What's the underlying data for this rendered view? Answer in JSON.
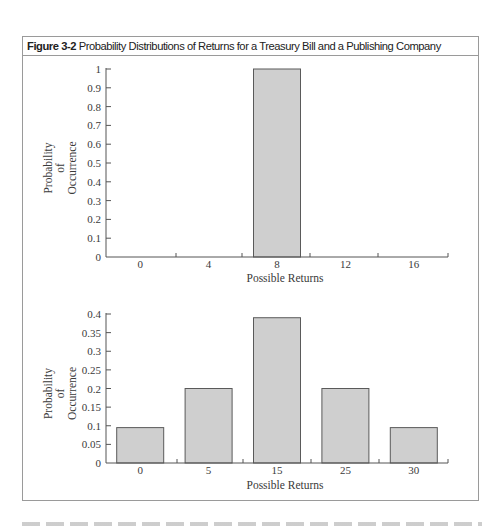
{
  "figure": {
    "label": "Figure 3-2",
    "title": "Probability Distributions of Returns for a Treasury Bill and a Publishing Company"
  },
  "chart_data": [
    {
      "type": "bar",
      "title": "Treasury Bill",
      "xlabel": "Possible Returns",
      "ylabel": [
        "Probability",
        "of",
        "Occurrence"
      ],
      "categories": [
        "0",
        "4",
        "8",
        "12",
        "16"
      ],
      "values": [
        0,
        0,
        1.0,
        0,
        0
      ],
      "ylim": [
        0,
        1
      ],
      "yticks": [
        "0",
        "0.1",
        "0.2",
        "0.3",
        "0.4",
        "0.5",
        "0.6",
        "0.7",
        "0.8",
        "0.9",
        "1"
      ],
      "ytick_values": [
        0,
        0.1,
        0.2,
        0.3,
        0.4,
        0.5,
        0.6,
        0.7,
        0.8,
        0.9,
        1
      ],
      "grid": false,
      "bar_color": "#cfcfcf"
    },
    {
      "type": "bar",
      "title": "Publishing Company",
      "xlabel": "Possible Returns",
      "ylabel": [
        "Probability",
        "of",
        "Occurrence"
      ],
      "categories": [
        "0",
        "5",
        "15",
        "25",
        "30"
      ],
      "values": [
        0.095,
        0.2,
        0.39,
        0.2,
        0.095
      ],
      "ylim": [
        0,
        0.4
      ],
      "yticks": [
        "0",
        "0.05",
        "0.1",
        "0.15",
        "0.2",
        "0.25",
        "0.3",
        "0.35",
        "0.4"
      ],
      "ytick_values": [
        0,
        0.05,
        0.1,
        0.15,
        0.2,
        0.25,
        0.3,
        0.35,
        0.4
      ],
      "grid": false,
      "bar_color": "#cfcfcf"
    }
  ]
}
